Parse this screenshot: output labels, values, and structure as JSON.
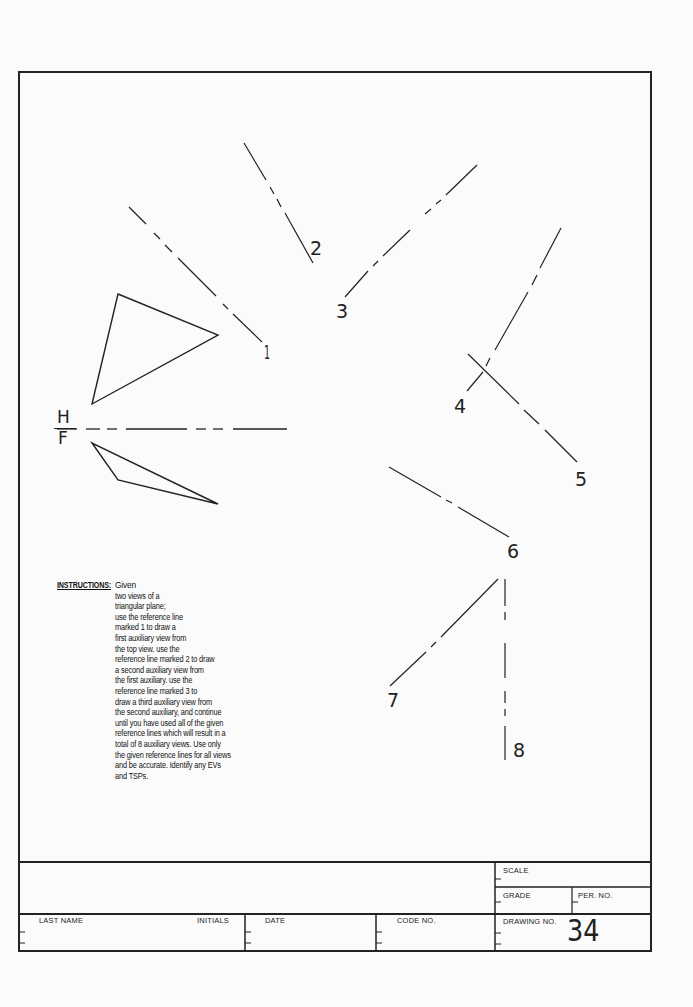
{
  "sheet": {
    "drawing_number": "34"
  },
  "projection": {
    "fold_line": {
      "top_label": "H",
      "bottom_label": "F"
    }
  },
  "reference_lines": [
    {
      "label": "1"
    },
    {
      "label": "2"
    },
    {
      "label": "3"
    },
    {
      "label": "4"
    },
    {
      "label": "5"
    },
    {
      "label": "6"
    },
    {
      "label": "7"
    },
    {
      "label": "8"
    }
  ],
  "instructions": {
    "heading": "INSTRUCTIONS:",
    "lines": [
      "Given",
      "two views of a",
      "triangular plane;",
      "use the reference  line",
      "marked 1 to draw a",
      "first auxiliary view from",
      "the top view.  use the",
      "reference line marked 2 to draw",
      "a second auxiliary view from",
      "the first auxiliary.  use the",
      "reference line marked 3 to",
      "draw a third auxiliary view from",
      "the second auxiliary,  and continue",
      "until you have used all of the given",
      "reference lines which will result in a",
      "total of 8 auxiliary views.  Use only",
      "the given reference lines for all views",
      "and be accurate.  Identify any EVs",
      "and TSPs."
    ]
  },
  "title_block": {
    "last_name_label": "LAST  NAME",
    "initials_label": "INITIALS",
    "date_label": "DATE",
    "code_no_label": "CODE  NO.",
    "scale_label": "SCALE",
    "grade_label": "GRADE",
    "per_no_label": "PER.  NO.",
    "drawing_no_label": "DRAWING  NO."
  }
}
